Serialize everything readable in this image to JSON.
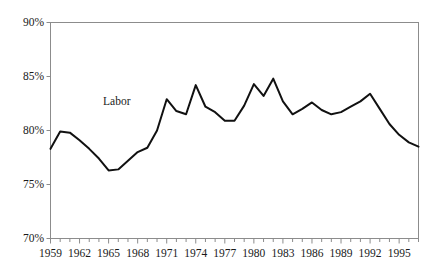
{
  "chart_data": {
    "type": "line",
    "title": "",
    "subtitle": "",
    "xlabel": "",
    "ylabel": "",
    "grid": false,
    "legend_position": "inline-annotation",
    "series_label": "Labor",
    "xlim": [
      1959,
      1997
    ],
    "ylim": [
      70,
      90
    ],
    "ytick_labels": [
      "90%",
      "85%",
      "80%",
      "75%",
      "70%"
    ],
    "ytick_values": [
      90,
      85,
      80,
      75,
      70
    ],
    "xtick_labels": [
      "1959",
      "1962",
      "1965",
      "1968",
      "1971",
      "1974",
      "1977",
      "1980",
      "1983",
      "1986",
      "1989",
      "1992",
      "1995"
    ],
    "xtick_values": [
      1959,
      1962,
      1965,
      1968,
      1971,
      1974,
      1977,
      1980,
      1983,
      1986,
      1989,
      1992,
      1995
    ],
    "minor_tick_interval": 1,
    "series": [
      {
        "name": "Labor",
        "color": "#111111",
        "x": [
          1959,
          1960,
          1961,
          1962,
          1963,
          1964,
          1965,
          1966,
          1967,
          1968,
          1969,
          1970,
          1971,
          1972,
          1973,
          1974,
          1975,
          1976,
          1977,
          1978,
          1979,
          1980,
          1981,
          1982,
          1983,
          1984,
          1985,
          1986,
          1987,
          1988,
          1989,
          1990,
          1991,
          1992,
          1993,
          1994,
          1995,
          1996,
          1997
        ],
        "values": [
          78.3,
          79.9,
          79.8,
          79.1,
          78.3,
          77.4,
          76.3,
          76.4,
          77.2,
          78.0,
          78.4,
          80.0,
          82.9,
          81.8,
          81.5,
          84.2,
          82.2,
          81.7,
          80.9,
          80.9,
          82.3,
          84.3,
          83.2,
          84.8,
          82.7,
          81.5,
          82.0,
          82.6,
          81.9,
          81.5,
          81.7,
          82.2,
          82.7,
          83.4,
          82.0,
          80.6,
          79.6,
          78.9,
          78.5
        ]
      }
    ]
  },
  "axes": {
    "frame_color": "#8c8c8c",
    "line_color": "#111111"
  },
  "annotation": {
    "label": "Labor"
  }
}
